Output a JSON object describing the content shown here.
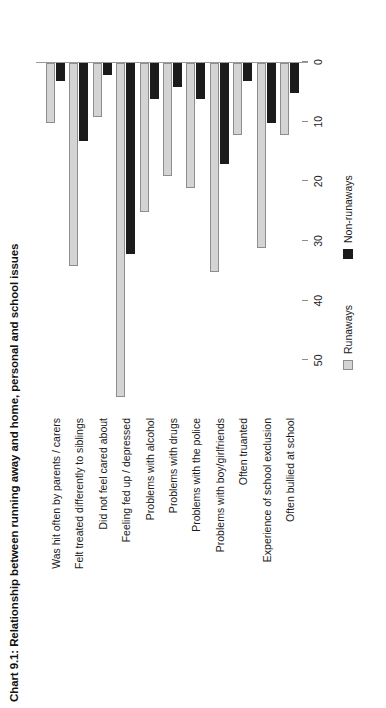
{
  "chart_data": {
    "type": "bar",
    "orientation": "vertical-bars-rotated",
    "title": "Chart 9.1: Relationship between running away and home, personal and school issues",
    "xlabel": "",
    "ylabel": "",
    "ylim": [
      0,
      58
    ],
    "grid": false,
    "legend_position": "bottom-center",
    "ticks": [
      "0",
      "10",
      "20",
      "30",
      "40",
      "50"
    ],
    "tick_values": [
      0,
      10,
      20,
      30,
      40,
      50
    ],
    "categories": [
      "Was hit often by parents / carers",
      "Felt treated differently to siblings",
      "Did not feel cared about",
      "Feeling fed up / depressed",
      "Problems with alcohol",
      "Problems with drugs",
      "Problems with the police",
      "Problems with boy/girlfriends",
      "Often truanted",
      "Experience of school exclusion",
      "Often bullied at school"
    ],
    "series": [
      {
        "name": "Runaways",
        "color": "#d4d4d4",
        "values": [
          10,
          34,
          9,
          56,
          25,
          19,
          21,
          35,
          12,
          31,
          12
        ]
      },
      {
        "name": "Non-runaways",
        "color": "#1b1b1b",
        "values": [
          3,
          13,
          2,
          32,
          6,
          4,
          6,
          17,
          3,
          10,
          5
        ]
      }
    ]
  },
  "legend": {
    "entries": [
      {
        "label": "Runaways",
        "swatch": "light-gray-square"
      },
      {
        "label": "Non-runaways",
        "swatch": "black-square"
      }
    ]
  }
}
